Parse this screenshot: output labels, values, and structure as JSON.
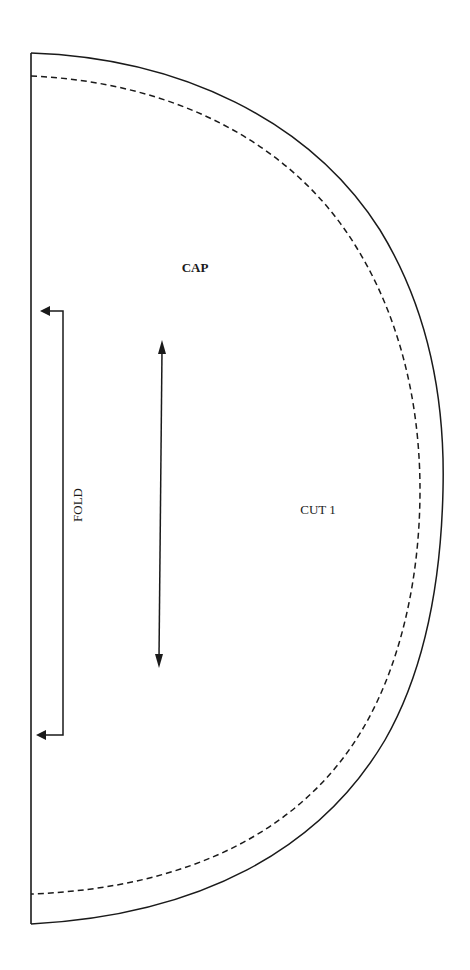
{
  "pattern": {
    "piece_name": "CAP",
    "cut_instruction": "CUT 1",
    "fold_label": "FOLD",
    "line_color": "#1a1a1a",
    "background": "#ffffff",
    "lines": {
      "cutting_line": "solid",
      "seam_line": "dashed"
    },
    "markers": {
      "grainline": "double-arrow",
      "fold_bracket": "place-on-fold"
    }
  }
}
